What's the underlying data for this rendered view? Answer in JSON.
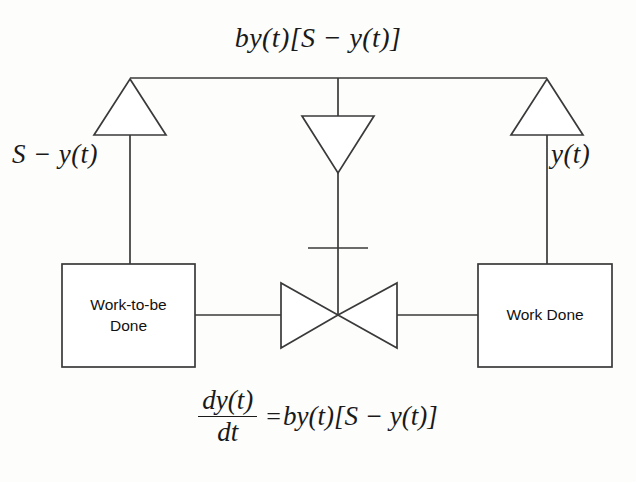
{
  "diagram": {
    "type": "system-dynamics-stock-and-flow",
    "title_equation": "by(t)[S − y(t)]",
    "flow_rate_label": {
      "full": "by(t)[S − y(t)]",
      "coefficient": "b",
      "term_1": "y(t)",
      "bracket_open": "[",
      "term_2": "S",
      "minus": "−",
      "term_3": "y(t)",
      "bracket_close": "]"
    },
    "converters": [
      {
        "name": "left-converter",
        "shape": "triangle-up",
        "label": "S − y(t)",
        "label_parts": {
          "lhs": "S",
          "op": "−",
          "rhs": "y(t)"
        },
        "connects_to": "Work-to-be Done"
      },
      {
        "name": "center-converter",
        "shape": "triangle-down",
        "label": "",
        "connects_to": "flow-valve"
      },
      {
        "name": "right-converter",
        "shape": "triangle-up",
        "label": "y(t)",
        "connects_to": "Work Done"
      }
    ],
    "stocks": [
      {
        "name": "work-to-be-done",
        "label": "Work-to-be Done",
        "line_1": "Work-to-be",
        "line_2": "Done",
        "position": "left"
      },
      {
        "name": "work-done",
        "label": "Work Done",
        "line_1": "Work Done",
        "line_2": "",
        "position": "right"
      }
    ],
    "flow": {
      "name": "work-completion-flow",
      "valve_shape": "bowtie",
      "direction": "left-to-right",
      "from": "Work-to-be Done",
      "to": "Work Done"
    },
    "differential_equation": {
      "full": "dy(t)/dt = by(t)[S − y(t)]",
      "numerator": "dy(t)",
      "denominator": "dt",
      "equals": "=",
      "rhs": "by(t)[S − y(t)]",
      "rhs_prefix": "by(t)",
      "rhs_bracket_open": "[",
      "rhs_inner_lhs": "S",
      "rhs_inner_op": "−",
      "rhs_inner_rhs": "y(t)",
      "rhs_bracket_close": "]"
    },
    "colors": {
      "stroke": "#3a3a3a",
      "text": "#1a1a1a",
      "background": "#fdfdfc"
    }
  }
}
